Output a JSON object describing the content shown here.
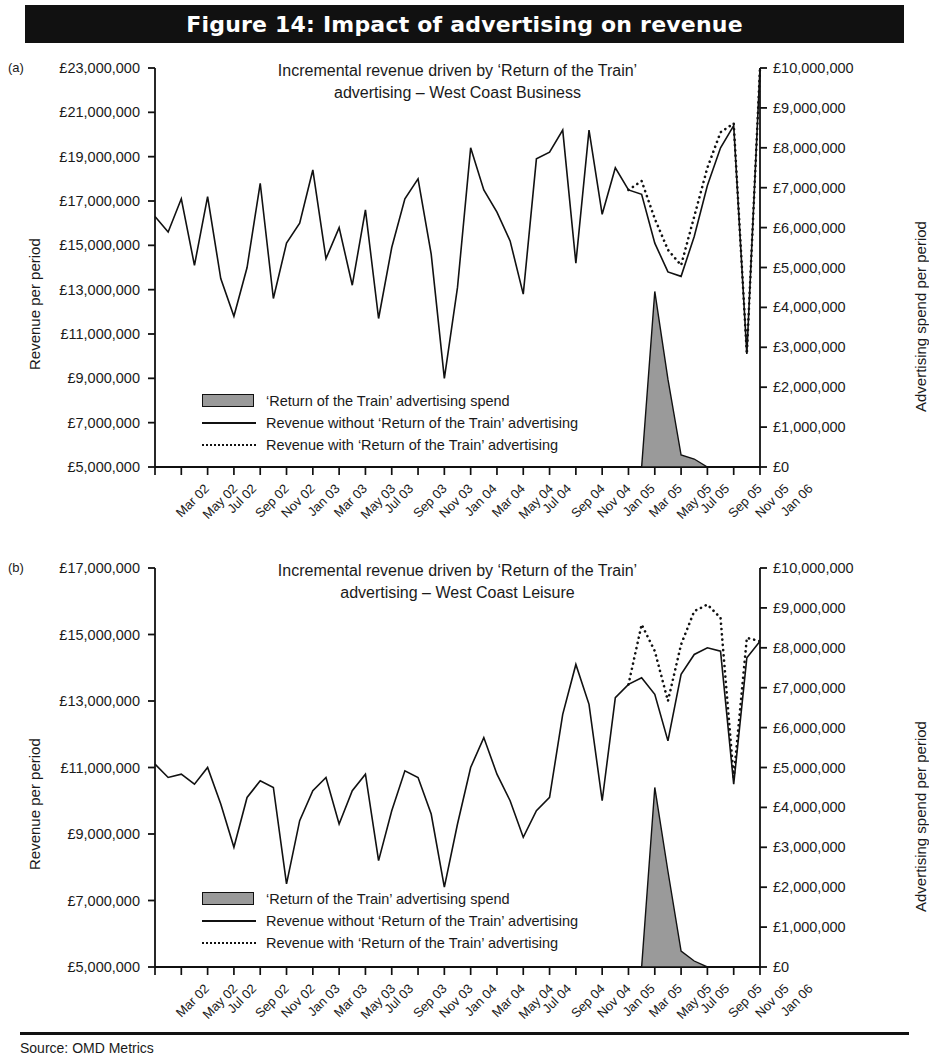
{
  "figure": {
    "banner_title": "Figure 14: Impact of advertising on revenue",
    "source": "Source: OMD Metrics",
    "panel_a_letter": "(a)",
    "panel_b_letter": "(b)"
  },
  "legend": {
    "items": [
      {
        "key": "swatch",
        "label": "‘Return of the Train’ advertising spend"
      },
      {
        "key": "solid",
        "label": "Revenue without ‘Return of the Train’ advertising"
      },
      {
        "key": "dotted",
        "label": "Revenue with ‘Return of the Train’ advertising"
      }
    ]
  },
  "colors": {
    "spend_fill": "#9a9a9a",
    "line": "#111111",
    "banner_bg": "#111111",
    "banner_fg": "#ffffff"
  },
  "chart_data": [
    {
      "id": "panel-a",
      "type": "line",
      "title": "Incremental revenue driven by ‘Return of the Train’\nadvertising – West Coast Business",
      "xlabel": "",
      "ylabel": "Revenue per period",
      "y2label": "Advertising spend per period",
      "grid": false,
      "legend_position": "inside-lower-left",
      "ylim": [
        5000000,
        23000000
      ],
      "yticks": [
        5000000,
        7000000,
        9000000,
        11000000,
        13000000,
        15000000,
        17000000,
        19000000,
        21000000,
        23000000
      ],
      "ytick_labels": [
        "£5,000,000",
        "£7,000,000",
        "£9,000,000",
        "£11,000,000",
        "£13,000,000",
        "£15,000,000",
        "£17,000,000",
        "£19,000,000",
        "£21,000,000",
        "£23,000,000"
      ],
      "y2lim": [
        0,
        10000000
      ],
      "y2ticks": [
        0,
        1000000,
        2000000,
        3000000,
        4000000,
        5000000,
        6000000,
        7000000,
        8000000,
        9000000,
        10000000
      ],
      "y2tick_labels": [
        "£0",
        "£1,000,000",
        "£2,000,000",
        "£3,000,000",
        "£4,000,000",
        "£5,000,000",
        "£6,000,000",
        "£7,000,000",
        "£8,000,000",
        "£9,000,000",
        "£10,000,000"
      ],
      "x": [
        "Mar 02",
        "Apr 02",
        "May 02",
        "Jun 02",
        "Jul 02",
        "Aug 02",
        "Sep 02",
        "Oct 02",
        "Nov 02",
        "Dec 02",
        "Jan 03",
        "Feb 03",
        "Mar 03",
        "Apr 03",
        "May 03",
        "Jun 03",
        "Jul 03",
        "Aug 03",
        "Sep 03",
        "Oct 03",
        "Nov 03",
        "Dec 03",
        "Jan 04",
        "Feb 04",
        "Mar 04",
        "Apr 04",
        "May 04",
        "Jun 04",
        "Jul 04",
        "Aug 04",
        "Sep 04",
        "Oct 04",
        "Nov 04",
        "Dec 04",
        "Jan 05",
        "Feb 05",
        "Mar 05",
        "Apr 05",
        "May 05",
        "Jun 05",
        "Jul 05",
        "Aug 05",
        "Sep 05",
        "Oct 05",
        "Nov 05",
        "Dec 05",
        "Jan 06"
      ],
      "xtick_labels": [
        "Mar 02",
        "May 02",
        "Jul 02",
        "Sep 02",
        "Nov 02",
        "Jan 03",
        "Mar 03",
        "May 03",
        "Jul 03",
        "Sep 03",
        "Nov 03",
        "Jan 04",
        "Mar 04",
        "May 04",
        "Jul 04",
        "Sep 04",
        "Nov 04",
        "Jan 05",
        "Mar 05",
        "May 05",
        "Jul 05",
        "Sep 05",
        "Nov 05",
        "Jan 06"
      ],
      "series": [
        {
          "name": "Revenue without ‘Return of the Train’ advertising",
          "style": "solid",
          "values": [
            16300000,
            15600000,
            17100000,
            14100000,
            17200000,
            13500000,
            11800000,
            14000000,
            17800000,
            12600000,
            15100000,
            16000000,
            18400000,
            14400000,
            15800000,
            13200000,
            16600000,
            11700000,
            14900000,
            17100000,
            18000000,
            14600000,
            9000000,
            13100000,
            19400000,
            17500000,
            16500000,
            15200000,
            12800000,
            18900000,
            19200000,
            20200000,
            14200000,
            20200000,
            16400000,
            18500000,
            17500000,
            17300000,
            15100000,
            13800000,
            13600000,
            15400000,
            17700000,
            19400000,
            20400000,
            10100000,
            23000000
          ]
        },
        {
          "name": "Revenue with ‘Return of the Train’ advertising",
          "style": "dotted",
          "start_index": 36,
          "values": [
            null,
            null,
            null,
            null,
            null,
            null,
            null,
            null,
            null,
            null,
            null,
            null,
            null,
            null,
            null,
            null,
            null,
            null,
            null,
            null,
            null,
            null,
            null,
            null,
            null,
            null,
            null,
            null,
            null,
            null,
            null,
            null,
            null,
            null,
            null,
            null,
            17500000,
            17900000,
            16200000,
            14800000,
            14100000,
            16300000,
            18500000,
            20100000,
            20500000,
            10100000,
            23000000
          ]
        },
        {
          "name": "‘Return of the Train’ advertising spend",
          "style": "area",
          "axis": "right",
          "values": [
            0,
            0,
            0,
            0,
            0,
            0,
            0,
            0,
            0,
            0,
            0,
            0,
            0,
            0,
            0,
            0,
            0,
            0,
            0,
            0,
            0,
            0,
            0,
            0,
            0,
            0,
            0,
            0,
            0,
            0,
            0,
            0,
            0,
            0,
            0,
            0,
            0,
            0,
            4400000,
            2200000,
            300000,
            200000,
            0,
            0,
            0,
            0,
            0
          ]
        }
      ]
    },
    {
      "id": "panel-b",
      "type": "line",
      "title": "Incremental revenue driven by ‘Return of the Train’\nadvertising – West Coast Leisure",
      "xlabel": "",
      "ylabel": "Revenue per period",
      "y2label": "Advertising spend per period",
      "grid": false,
      "legend_position": "inside-lower-left",
      "ylim": [
        5000000,
        17000000
      ],
      "yticks": [
        5000000,
        7000000,
        9000000,
        11000000,
        13000000,
        15000000,
        17000000
      ],
      "ytick_labels": [
        "£5,000,000",
        "£7,000,000",
        "£9,000,000",
        "£11,000,000",
        "£13,000,000",
        "£15,000,000",
        "£17,000,000"
      ],
      "y2lim": [
        0,
        10000000
      ],
      "y2ticks": [
        0,
        1000000,
        2000000,
        3000000,
        4000000,
        5000000,
        6000000,
        7000000,
        8000000,
        9000000,
        10000000
      ],
      "y2tick_labels": [
        "£0",
        "£1,000,000",
        "£2,000,000",
        "£3,000,000",
        "£4,000,000",
        "£5,000,000",
        "£6,000,000",
        "£7,000,000",
        "£8,000,000",
        "£9,000,000",
        "£10,000,000"
      ],
      "x": [
        "Mar 02",
        "Apr 02",
        "May 02",
        "Jun 02",
        "Jul 02",
        "Aug 02",
        "Sep 02",
        "Oct 02",
        "Nov 02",
        "Dec 02",
        "Jan 03",
        "Feb 03",
        "Mar 03",
        "Apr 03",
        "May 03",
        "Jun 03",
        "Jul 03",
        "Aug 03",
        "Sep 03",
        "Oct 03",
        "Nov 03",
        "Dec 03",
        "Jan 04",
        "Feb 04",
        "Mar 04",
        "Apr 04",
        "May 04",
        "Jun 04",
        "Jul 04",
        "Aug 04",
        "Sep 04",
        "Oct 04",
        "Nov 04",
        "Dec 04",
        "Jan 05",
        "Feb 05",
        "Mar 05",
        "Apr 05",
        "May 05",
        "Jun 05",
        "Jul 05",
        "Aug 05",
        "Sep 05",
        "Oct 05",
        "Nov 05",
        "Dec 05",
        "Jan 06"
      ],
      "xtick_labels": [
        "Mar 02",
        "May 02",
        "Jul 02",
        "Sep 02",
        "Nov 02",
        "Jan 03",
        "Mar 03",
        "May 03",
        "Jul 03",
        "Sep 03",
        "Nov 03",
        "Jan 04",
        "Mar 04",
        "May 04",
        "Jul 04",
        "Sep 04",
        "Nov 04",
        "Jan 05",
        "Mar 05",
        "May 05",
        "Jul 05",
        "Sep 05",
        "Nov 05",
        "Jan 06"
      ],
      "series": [
        {
          "name": "Revenue without ‘Return of the Train’ advertising",
          "style": "solid",
          "values": [
            11100000,
            10700000,
            10800000,
            10500000,
            11000000,
            9900000,
            8600000,
            10100000,
            10600000,
            10400000,
            7500000,
            9400000,
            10300000,
            10700000,
            9300000,
            10300000,
            10800000,
            8200000,
            9700000,
            10900000,
            10700000,
            9600000,
            7400000,
            9300000,
            11000000,
            11900000,
            10800000,
            10000000,
            8900000,
            9700000,
            10100000,
            12600000,
            14100000,
            12900000,
            10000000,
            13100000,
            13500000,
            13700000,
            13200000,
            11800000,
            13800000,
            14400000,
            14600000,
            14500000,
            10500000,
            14300000,
            14800000
          ]
        },
        {
          "name": "Revenue with ‘Return of the Train’ advertising",
          "style": "dotted",
          "start_index": 36,
          "values": [
            null,
            null,
            null,
            null,
            null,
            null,
            null,
            null,
            null,
            null,
            null,
            null,
            null,
            null,
            null,
            null,
            null,
            null,
            null,
            null,
            null,
            null,
            null,
            null,
            null,
            null,
            null,
            null,
            null,
            null,
            null,
            null,
            null,
            null,
            null,
            null,
            13500000,
            15300000,
            14500000,
            13000000,
            14700000,
            15700000,
            15900000,
            15500000,
            10700000,
            14900000,
            14800000
          ]
        },
        {
          "name": "‘Return of the Train’ advertising spend",
          "style": "area",
          "axis": "right",
          "values": [
            0,
            0,
            0,
            0,
            0,
            0,
            0,
            0,
            0,
            0,
            0,
            0,
            0,
            0,
            0,
            0,
            0,
            0,
            0,
            0,
            0,
            0,
            0,
            0,
            0,
            0,
            0,
            0,
            0,
            0,
            0,
            0,
            0,
            0,
            0,
            0,
            0,
            0,
            4500000,
            2400000,
            400000,
            150000,
            0,
            0,
            0,
            0,
            0
          ]
        }
      ]
    }
  ]
}
